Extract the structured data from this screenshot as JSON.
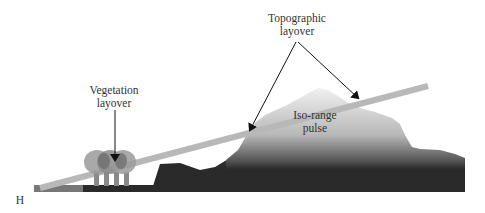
{
  "labels": {
    "topographic_layover": "Topographic\nlayover",
    "topographic_line1": "Topographic",
    "topographic_line2": "layover",
    "vegetation_line1": "Vegetation",
    "vegetation_line2": "layover",
    "isorange_line1": "Iso-range",
    "isorange_line2": "pulse",
    "h_label": "H"
  },
  "colors": {
    "terrain_dark": "#2a2a2a",
    "terrain_light": "#e6e6e6",
    "pulse": "#b8b8b8",
    "ground_left": "#777777",
    "tree": "#8a8a8a",
    "arrow": "#111111"
  }
}
